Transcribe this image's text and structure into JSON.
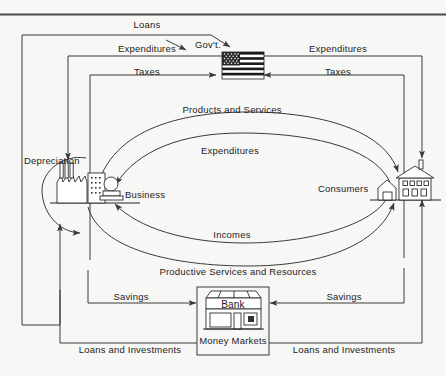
{
  "diagram": {
    "background_color": "#f7f7f5",
    "line_color": "#3a3a3a",
    "text_color": "#1d1d1d",
    "top_rule_color": "#4a4a4a"
  },
  "nodes": {
    "government": {
      "label": "Gov't.",
      "icon": "us-flag-icon"
    },
    "business": {
      "label": "Business",
      "icon": "factory-icon"
    },
    "consumers": {
      "label": "Consumers",
      "icon": "house-icon"
    },
    "bank": {
      "label": "Bank",
      "sublabel": "Money Markets",
      "icon": "bank-building-icon"
    }
  },
  "flows": {
    "loans_gov": "Loans",
    "expenditures_left": "Expenditures",
    "taxes_left": "Taxes",
    "expenditures_right": "Expenditures",
    "taxes_right": "Taxes",
    "products_and_services": "Products and Services",
    "expenditures_center": "Expenditures",
    "incomes": "Incomes",
    "productive_services": "Productive Services and Resources",
    "depreciation": "Depreciation",
    "savings_left": "Savings",
    "savings_right": "Savings",
    "loans_investments_left": "Loans and Investments",
    "loans_investments_right": "Loans and Investments"
  }
}
